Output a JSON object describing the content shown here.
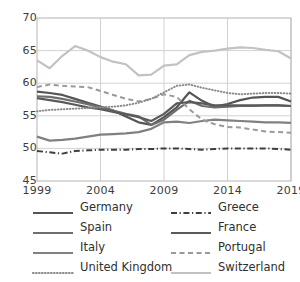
{
  "chart_data": {
    "type": "line",
    "title": "",
    "xlabel": "",
    "ylabel": "",
    "xlim": [
      1999,
      2019
    ],
    "ylim": [
      45,
      70
    ],
    "yticks": [
      45,
      50,
      55,
      60,
      65,
      70
    ],
    "xticks": [
      1999,
      2004,
      2009,
      2014,
      2019
    ],
    "grid": true,
    "legend_position": "bottom",
    "x": [
      1999,
      2000,
      2001,
      2002,
      2003,
      2004,
      2005,
      2006,
      2007,
      2008,
      2009,
      2010,
      2011,
      2012,
      2013,
      2014,
      2015,
      2016,
      2017,
      2018,
      2019
    ],
    "series": [
      {
        "name": "Germany",
        "style": "solid",
        "color": "#555555",
        "width": 2.2,
        "values": [
          58.7,
          58.5,
          58.2,
          57.6,
          57.0,
          56.4,
          55.8,
          54.9,
          54.0,
          53.6,
          54.8,
          56.3,
          58.6,
          57.3,
          56.4,
          56.8,
          57.4,
          57.8,
          57.9,
          57.9,
          57.2
        ]
      },
      {
        "name": "Greece",
        "style": "dashdot",
        "color": "#3f3f3f",
        "width": 2.0,
        "values": [
          49.6,
          49.4,
          49.2,
          49.6,
          49.7,
          49.8,
          49.8,
          49.8,
          49.9,
          49.9,
          50.0,
          50.0,
          49.9,
          49.8,
          49.9,
          50.0,
          50.0,
          50.0,
          50.0,
          49.9,
          49.8
        ]
      },
      {
        "name": "Spain",
        "style": "solid",
        "color": "#6e6e6e",
        "width": 2.2,
        "values": [
          58.0,
          57.9,
          57.6,
          57.2,
          56.8,
          56.3,
          55.8,
          55.3,
          54.9,
          53.6,
          54.4,
          55.9,
          57.3,
          56.5,
          56.3,
          56.4,
          56.5,
          56.5,
          56.6,
          56.6,
          56.5
        ]
      },
      {
        "name": "France",
        "style": "solid",
        "color": "#5a5a5a",
        "width": 2.2,
        "values": [
          57.7,
          57.4,
          57.1,
          56.7,
          56.3,
          56.0,
          55.6,
          55.2,
          54.8,
          54.2,
          55.3,
          56.9,
          57.1,
          56.9,
          56.6,
          56.6,
          56.6,
          56.6,
          56.6,
          56.6,
          56.5
        ]
      },
      {
        "name": "Italy",
        "style": "solid",
        "color": "#808080",
        "width": 2.2,
        "values": [
          51.8,
          51.2,
          51.3,
          51.5,
          51.8,
          52.1,
          52.2,
          52.3,
          52.5,
          53.0,
          54.0,
          54.1,
          53.9,
          54.2,
          54.4,
          54.3,
          54.2,
          54.1,
          54.0,
          54.0,
          53.9
        ]
      },
      {
        "name": "Portugal",
        "style": "dashed",
        "color": "#9a9a9a",
        "width": 2.0,
        "values": [
          59.4,
          59.8,
          59.6,
          59.5,
          59.4,
          58.8,
          58.2,
          57.6,
          57.2,
          57.6,
          58.3,
          57.9,
          56.0,
          54.4,
          53.7,
          53.3,
          53.2,
          52.9,
          52.6,
          52.5,
          52.4
        ]
      },
      {
        "name": "United Kingdom",
        "style": "dotted",
        "color": "#8c8c8c",
        "width": 2.0,
        "values": [
          55.7,
          55.9,
          56.0,
          56.1,
          56.2,
          56.3,
          56.4,
          56.6,
          57.0,
          57.6,
          58.6,
          59.6,
          59.8,
          59.3,
          58.9,
          58.5,
          58.3,
          58.4,
          58.5,
          58.5,
          58.4
        ]
      },
      {
        "name": "Switzerland",
        "style": "solid",
        "color": "#c2c2c2",
        "width": 2.2,
        "values": [
          63.5,
          62.3,
          64.2,
          65.7,
          65.0,
          64.0,
          63.3,
          62.9,
          61.2,
          61.3,
          62.7,
          62.9,
          64.3,
          64.8,
          65.0,
          65.3,
          65.5,
          65.4,
          65.1,
          64.9,
          63.8
        ]
      }
    ]
  },
  "axes": {
    "y_labels": [
      "70",
      "65",
      "60",
      "55",
      "50",
      "45"
    ],
    "x_labels": [
      "1999",
      "2004",
      "2009",
      "2014",
      "2019"
    ]
  },
  "legend": {
    "items": [
      {
        "label": "Germany",
        "swatch": "legend-swatch-germany"
      },
      {
        "label": "Greece",
        "swatch": "legend-swatch-greece"
      },
      {
        "label": "Spain",
        "swatch": "legend-swatch-spain"
      },
      {
        "label": "France",
        "swatch": "legend-swatch-france"
      },
      {
        "label": "Italy",
        "swatch": "legend-swatch-italy"
      },
      {
        "label": "Portugal",
        "swatch": "legend-swatch-portugal"
      },
      {
        "label": "United Kingdom",
        "swatch": "legend-swatch-united-kingdom"
      },
      {
        "label": "Switzerland",
        "swatch": "legend-swatch-switzerland"
      }
    ]
  }
}
